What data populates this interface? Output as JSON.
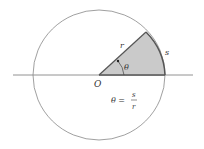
{
  "diagram": {
    "labels": {
      "origin": "O",
      "radius": "r",
      "arc": "s",
      "angle": "θ",
      "formula_lhs": "θ =",
      "formula_num": "s",
      "formula_den": "r"
    },
    "colors": {
      "stroke": "#555555",
      "sector_fill": "#c8c8c8",
      "sector_edge": "#666666",
      "text": "#333333"
    },
    "geometry": {
      "center": [
        99,
        75
      ],
      "radius": 66,
      "angle_deg": 40,
      "axis_x": [
        13,
        193
      ]
    }
  }
}
